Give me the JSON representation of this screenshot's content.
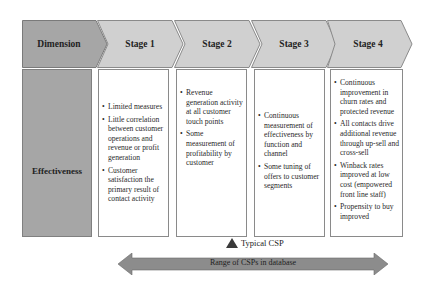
{
  "header": {
    "dimension_label": "Dimension",
    "stages": [
      {
        "label": "Stage 1"
      },
      {
        "label": "Stage 2"
      },
      {
        "label": "Stage 3"
      },
      {
        "label": "Stage 4"
      }
    ]
  },
  "row": {
    "label": "Effectiveness",
    "columns": [
      {
        "items": [
          "Limited measures",
          "Little correlation between customer operations and revenue or profit generation",
          "Customer satisfaction the primary result of contact activity"
        ]
      },
      {
        "items": [
          "Revenue generation activity at all customer touch points",
          "Some measurement of profitability by customer"
        ]
      },
      {
        "items": [
          "Continuous measurement of effectiveness by function and channel",
          "Some tuning of offers to customer segments"
        ]
      },
      {
        "items": [
          "Continuous improvement in churn rates and protected revenue",
          "All contacts drive additional revenue through up-sell and cross-sell",
          "Winback rates improved at low cost (empowered front line staff)",
          "Propensity to buy improved"
        ]
      }
    ]
  },
  "legend": {
    "marker_label": "Typical CSP",
    "marker_icon": "triangle-up-icon",
    "range_label": "Range of CSPs in database"
  },
  "colors": {
    "dimension_fill": "#a6a6a6",
    "stage_fill": "#d0d0d0",
    "arrow_fill": "#8c8c8c",
    "border": "#808080"
  }
}
